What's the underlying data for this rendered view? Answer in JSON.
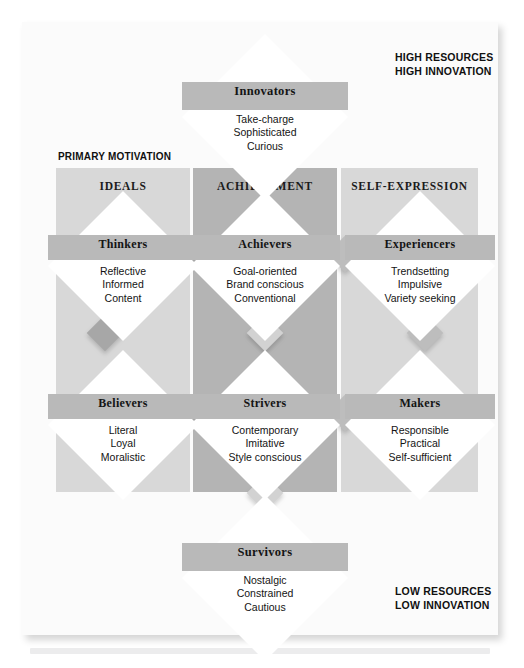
{
  "figure": {
    "type": "vals-framework-diagram",
    "title_axis_captions": {
      "top_right": [
        "HIGH RESOURCES",
        "HIGH INNOVATION"
      ],
      "bottom_right": [
        "LOW RESOURCES",
        "LOW INNOVATION"
      ],
      "left_header": "PRIMARY MOTIVATION"
    },
    "columns": [
      {
        "id": "ideals",
        "label": "IDEALS",
        "color": "#d8d8d8"
      },
      {
        "id": "achievement",
        "label": "ACHIEVEMENT",
        "color": "#b4b4b4"
      },
      {
        "id": "self_expression",
        "label": "SELF-EXPRESSION",
        "color": "#d8d8d8"
      }
    ],
    "segments": [
      {
        "id": "innovators",
        "name": "Innovators",
        "position": "top-apex",
        "traits": [
          "Take-charge",
          "Sophisticated",
          "Curious"
        ]
      },
      {
        "id": "thinkers",
        "name": "Thinkers",
        "position": "ideals-high",
        "traits": [
          "Reflective",
          "Informed",
          "Content"
        ]
      },
      {
        "id": "achievers",
        "name": "Achievers",
        "position": "achievement-high",
        "traits": [
          "Goal-oriented",
          "Brand conscious",
          "Conventional"
        ]
      },
      {
        "id": "experiencers",
        "name": "Experiencers",
        "position": "self-expression-high",
        "traits": [
          "Trendsetting",
          "Impulsive",
          "Variety seeking"
        ]
      },
      {
        "id": "believers",
        "name": "Believers",
        "position": "ideals-low",
        "traits": [
          "Literal",
          "Loyal",
          "Moralistic"
        ]
      },
      {
        "id": "strivers",
        "name": "Strivers",
        "position": "achievement-low",
        "traits": [
          "Contemporary",
          "Imitative",
          "Style conscious"
        ]
      },
      {
        "id": "makers",
        "name": "Makers",
        "position": "self-expression-low",
        "traits": [
          "Responsible",
          "Practical",
          "Self-sufficient"
        ]
      },
      {
        "id": "survivors",
        "name": "Survivors",
        "position": "bottom-apex",
        "traits": [
          "Nostalgic",
          "Constrained",
          "Cautious"
        ]
      }
    ],
    "colors": {
      "panel_background": "#fbfbfb",
      "column_light": "#d8d8d8",
      "column_dark": "#b4b4b4",
      "diamond_fill": "#ffffff",
      "diamond_band": "#b9b9b9",
      "connector_dark": "#a7a7a7",
      "connector_light": "#d2d2d2",
      "text": "#141414"
    }
  }
}
